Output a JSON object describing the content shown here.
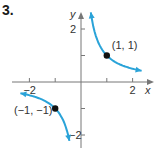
{
  "problem_number": "3.",
  "chart_data": {
    "type": "line",
    "title": "",
    "function": "y = 1/x",
    "xlabel": "x",
    "ylabel": "y",
    "xlim": [
      -2.6,
      2.8
    ],
    "ylim": [
      -2.3,
      2.6
    ],
    "x_ticks": [
      -2,
      -1,
      1,
      2
    ],
    "x_tick_labels": [
      "-2",
      "2"
    ],
    "y_ticks": [
      -2,
      -1,
      1,
      2
    ],
    "y_tick_labels": [
      "2",
      "-2"
    ],
    "grid": false,
    "series": [
      {
        "name": "branch-positive",
        "x": [
          0.38,
          0.5,
          0.75,
          1,
          1.5,
          2,
          2.35
        ],
        "y": [
          2.6,
          2.0,
          1.333,
          1,
          0.667,
          0.5,
          0.425
        ],
        "color": "#2aa3d8"
      },
      {
        "name": "branch-negative",
        "x": [
          -2.35,
          -2,
          -1.5,
          -1,
          -0.75,
          -0.5,
          -0.45
        ],
        "y": [
          -0.425,
          -0.5,
          -0.667,
          -1,
          -1.333,
          -2.0,
          -2.22
        ],
        "color": "#2aa3d8"
      }
    ],
    "points": [
      {
        "x": 1,
        "y": 1,
        "label": "(1, 1)"
      },
      {
        "x": -1,
        "y": -1,
        "label": "(−1, −1)"
      }
    ]
  }
}
